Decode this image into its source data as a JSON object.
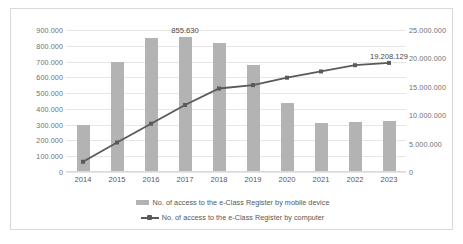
{
  "chart_data": {
    "type": "bar",
    "title": "",
    "subtitle": "",
    "xlabel": "",
    "ylabel": "",
    "categories": [
      "2014",
      "2015",
      "2016",
      "2017",
      "2018",
      "2019",
      "2020",
      "2021",
      "2022",
      "2023"
    ],
    "grid": true,
    "legend_position": "bottom",
    "axes": {
      "left": {
        "label": "",
        "min": 0,
        "max": 900000,
        "step": 100000,
        "ticks": [
          "0",
          "100.000",
          "200.000",
          "300.000",
          "400.000",
          "500.000",
          "600.000",
          "700.000",
          "800.000",
          "900.000"
        ]
      },
      "right": {
        "label": "",
        "min": 0,
        "max": 25000000,
        "step": 5000000,
        "ticks": [
          "0",
          "5.000.000",
          "10.000.000",
          "15.000.000",
          "20.000.000",
          "25.000.000"
        ]
      }
    },
    "series": [
      {
        "name": "No. of access to the e-Class Register by mobile device",
        "type": "bar",
        "axis": "left",
        "color": "#b3b3b3",
        "values": [
          300000,
          700000,
          850000,
          855630,
          820000,
          680000,
          437000,
          308000,
          318000,
          322000
        ]
      },
      {
        "name": "No. of access to the e-Class Register by computer",
        "type": "line",
        "axis": "right",
        "color": "#5a5a5a",
        "values": [
          1800000,
          5200000,
          8500000,
          11800000,
          14700000,
          15300000,
          16600000,
          17700000,
          18800000,
          19208129
        ]
      }
    ],
    "annotations": [
      {
        "text": "855.630",
        "series": "No. of access to the e-Class Register by mobile device",
        "category": "2017"
      },
      {
        "text": "19.208.129",
        "series": "No. of access to the e-Class Register by computer",
        "category": "2023"
      }
    ]
  },
  "legend": {
    "items": [
      {
        "label": "No. of access to the e-Class Register by mobile device",
        "marker": "bar-swatch-icon"
      },
      {
        "label": "No. of access to the e-Class Register by computer",
        "marker": "line-marker-icon"
      }
    ]
  }
}
